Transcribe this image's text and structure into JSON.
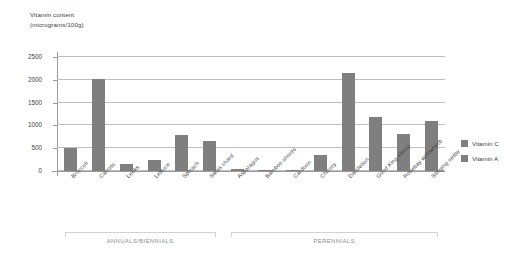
{
  "chart_data": {
    "type": "bar",
    "title_line1": "Vitamin content",
    "title_line2": "(micrograms/100g)",
    "xlabel": "",
    "ylabel": "Vitamin content (micrograms/100g)",
    "ylim": [
      0,
      2500
    ],
    "yticks": [
      0,
      500,
      1000,
      1500,
      2000,
      2500
    ],
    "ytick_labels": [
      "0",
      "500",
      "1000",
      "1500",
      "2000",
      "2500"
    ],
    "grid": true,
    "legend_position": "right",
    "categories": [
      "Broccoli",
      "Carrots",
      "Leeks",
      "Lettuce",
      "Spinach",
      "Swiss chard",
      "Asparagus",
      "Bamboo shoots",
      "Cardoon",
      "Chicory",
      "Dandelion",
      "Good King Henry",
      "Rosebay willowherb",
      "Stinging nettle"
    ],
    "values": [
      500,
      2010,
      150,
      250,
      800,
      650,
      45,
      25,
      25,
      350,
      2150,
      1180,
      820,
      1100
    ],
    "series": [
      {
        "name": "Vitamin A",
        "color": "#7f7f7f",
        "values": [
          500,
          2010,
          150,
          250,
          800,
          650,
          45,
          25,
          25,
          350,
          2150,
          1180,
          820,
          1100
        ]
      }
    ],
    "legend": [
      {
        "label": "Vitamin C",
        "color": "#7f7f7f"
      },
      {
        "label": "Vitamin A",
        "color": "#7f7f7f"
      }
    ],
    "groups": [
      {
        "label": "ANNUALS/BIENNIALS",
        "start_index": 0,
        "end_index": 5
      },
      {
        "label": "PERENNIALS",
        "start_index": 6,
        "end_index": 13
      }
    ],
    "colors": {
      "bar": "#7f7f7f",
      "gridline": "#bfbfbf",
      "axis": "#9a9a9a",
      "bracket": "#d2d2d2",
      "text": "#3d3d3d",
      "group_text": "#8d8d8d"
    }
  }
}
